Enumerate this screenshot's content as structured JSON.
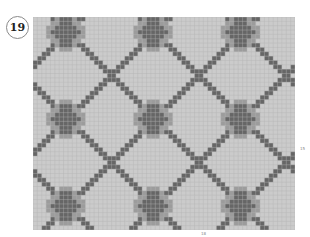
{
  "figure": {
    "number": "19",
    "right_label": "15",
    "bottom_label": "18"
  },
  "grid": {
    "columns": 60,
    "rows": 49,
    "repeat_cols": 20,
    "repeat_rows": 20,
    "motif_origin_col": 7,
    "motif_origin_row": 3,
    "colors": {
      "background": "#cbcbcb",
      "motif": "#9c9c9c",
      "line": "#666666",
      "gridline": "#b4b4b4"
    },
    "legend": [
      {
        "name": "background",
        "color": "#cbcbcb"
      },
      {
        "name": "motif",
        "color": "#9c9c9c"
      },
      {
        "name": "diagonal-line",
        "color": "#666666"
      }
    ]
  }
}
